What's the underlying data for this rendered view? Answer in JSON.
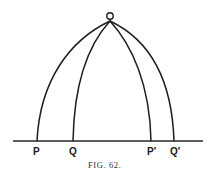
{
  "figure": {
    "caption": "FIG. 62.",
    "apex_label": "O",
    "points": [
      {
        "label": "P",
        "x": 37
      },
      {
        "label": "Q",
        "x": 73
      },
      {
        "label": "P′",
        "x": 151
      },
      {
        "label": "Q′",
        "x": 174
      }
    ],
    "baseline": {
      "x1": 13,
      "x2": 203,
      "y": 141
    },
    "apex": {
      "x": 110,
      "y": 22
    },
    "line_color": "#1e1e1e"
  }
}
